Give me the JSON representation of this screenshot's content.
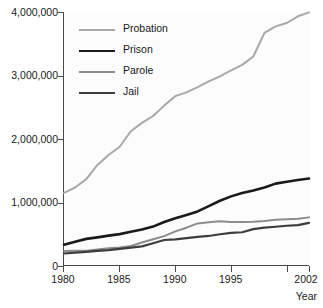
{
  "chart_data": {
    "type": "line",
    "title": "",
    "xlabel": "Year",
    "ylabel": "",
    "xlim": [
      1980,
      2002
    ],
    "ylim": [
      0,
      4000000
    ],
    "grid": false,
    "legend_position": "upper-left-inside",
    "x_tick_labels": [
      "1980",
      "1985",
      "1990",
      "1995",
      "2002"
    ],
    "x_tick_values": [
      1980,
      1985,
      1990,
      1995,
      2002
    ],
    "x_tick_marks": [
      1980,
      1985,
      1990,
      1995,
      2000,
      2002
    ],
    "y_tick_labels": [
      "0",
      "1,000,000",
      "2,000,000",
      "3,000,000",
      "4,000,000"
    ],
    "y_tick_values": [
      0,
      1000000,
      2000000,
      3000000,
      4000000
    ],
    "x": [
      1980,
      1981,
      1982,
      1983,
      1984,
      1985,
      1986,
      1987,
      1988,
      1989,
      1990,
      1991,
      1992,
      1993,
      1994,
      1995,
      1996,
      1997,
      1998,
      1999,
      2000,
      2001,
      2002
    ],
    "series": [
      {
        "name": "Probation",
        "color": "#a8a8a8",
        "width": 2.0,
        "values": [
          1140000,
          1225000,
          1357000,
          1582000,
          1740000,
          1870000,
          2115000,
          2247000,
          2356000,
          2520000,
          2670000,
          2729000,
          2811000,
          2903000,
          2981000,
          3078000,
          3164000,
          3296000,
          3670000,
          3773000,
          3826000,
          3932000,
          3995000
        ]
      },
      {
        "name": "Prison",
        "color": "#1a1a1a",
        "width": 2.6,
        "values": [
          320000,
          369000,
          413000,
          437000,
          464000,
          488000,
          526000,
          562000,
          607000,
          680000,
          740000,
          789000,
          847000,
          932000,
          1016000,
          1085000,
          1138000,
          1178000,
          1224000,
          1287000,
          1316000,
          1345000,
          1367000
        ]
      },
      {
        "name": "Parole",
        "color": "#8c8c8c",
        "width": 2.0,
        "values": [
          220000,
          225000,
          224000,
          246000,
          266000,
          277000,
          300000,
          355000,
          407000,
          456000,
          531000,
          590000,
          658000,
          676000,
          690000,
          679000,
          679000,
          685000,
          696000,
          714000,
          723000,
          732000,
          753000
        ]
      },
      {
        "name": "Jail",
        "color": "#3d3d3d",
        "width": 2.2,
        "values": [
          182000,
          196000,
          209000,
          223000,
          234000,
          256000,
          274000,
          295000,
          343000,
          395000,
          405000,
          426000,
          444000,
          459000,
          486000,
          507000,
          518000,
          567000,
          592000,
          605000,
          621000,
          631000,
          665000
        ]
      }
    ]
  },
  "legend": {
    "items": [
      {
        "label": "Probation"
      },
      {
        "label": "Prison"
      },
      {
        "label": "Parole"
      },
      {
        "label": "Jail"
      }
    ]
  },
  "axes": {
    "x_title": "Year"
  }
}
